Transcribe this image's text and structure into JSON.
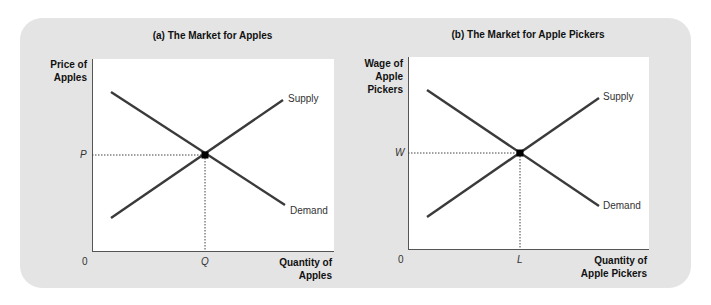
{
  "figure": {
    "background_color": "#e4e4e4",
    "line_color": "#3a3a3a",
    "panels": [
      {
        "id": "a",
        "title": "(a) The Market for Apples",
        "y_axis_label_lines": [
          "Price of",
          "Apples"
        ],
        "x_axis_label_lines": [
          "Quantity of",
          "Apples"
        ],
        "origin_label": "0",
        "equilibrium_y_label": "P",
        "equilibrium_x_label": "Q",
        "supply_label": "Supply",
        "demand_label": "Demand"
      },
      {
        "id": "b",
        "title": "(b) The Market for Apple Pickers",
        "y_axis_label_lines": [
          "Wage of",
          "Apple",
          "Pickers"
        ],
        "x_axis_label_lines": [
          "Quantity of",
          "Apple Pickers"
        ],
        "origin_label": "0",
        "equilibrium_y_label": "W",
        "equilibrium_x_label": "L",
        "supply_label": "Supply",
        "demand_label": "Demand"
      }
    ]
  }
}
